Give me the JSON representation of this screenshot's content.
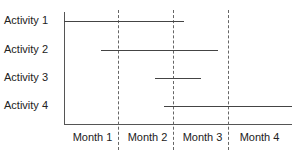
{
  "chart_data": {
    "type": "gantt",
    "title": "",
    "xlabel": "",
    "ylabel": "",
    "categories": [
      "Month 1",
      "Month 2",
      "Month 3",
      "Month 4"
    ],
    "xlim": [
      0,
      4
    ],
    "grid": "dashed vertical lines at month boundaries",
    "series": [
      {
        "name": "Activity 1",
        "start": 0.0,
        "end": 2.1
      },
      {
        "name": "Activity 2",
        "start": 0.65,
        "end": 2.7
      },
      {
        "name": "Activity 3",
        "start": 1.6,
        "end": 2.4
      },
      {
        "name": "Activity 4",
        "start": 1.75,
        "end": 4.0
      }
    ]
  },
  "labels": {
    "activities": [
      "Activity 1",
      "Activity 2",
      "Activity 3",
      "Activity 4"
    ],
    "months": [
      "Month 1",
      "Month 2",
      "Month 3",
      "Month 4"
    ]
  }
}
